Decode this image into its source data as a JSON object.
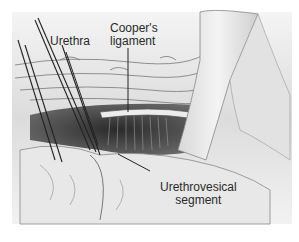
{
  "figure": {
    "type": "surgical-illustration",
    "labels": {
      "urethra": "Urethra",
      "coopers_line1": "Cooper's",
      "coopers_line2": "ligament",
      "urethrovesical_line1": "Urethrovesical",
      "urethrovesical_line2": "segment"
    },
    "colors": {
      "background": "#ffffff",
      "tissue_light": "#e6e6e6",
      "tissue_mid": "#b8b8b8",
      "tissue_dark": "#3a3a3a",
      "line": "#222222"
    }
  }
}
